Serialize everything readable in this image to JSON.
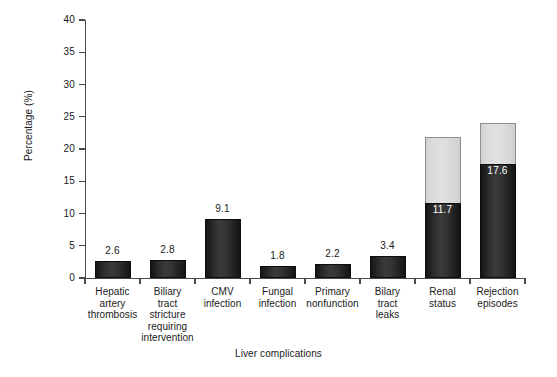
{
  "chart_data": {
    "type": "bar",
    "title": "",
    "xlabel": "Liver complications",
    "ylabel": "Percentage (%)",
    "ylim": [
      0,
      40
    ],
    "yticks": [
      0,
      5,
      10,
      15,
      20,
      25,
      30,
      35,
      40
    ],
    "grid": false,
    "legend": null,
    "stacked": true,
    "categories": [
      "Hepatic artery thrombosis",
      "Biliary tract stricture requiring intervention",
      "CMV infection",
      "Fungal infection",
      "Primary nonfunction",
      "Bilary tract leaks",
      "Renal status",
      "Rejection episodes"
    ],
    "category_lines": [
      [
        "Hepatic",
        "artery",
        "thrombosis"
      ],
      [
        "Biliary",
        "tract",
        "stricture",
        "requiring",
        "intervention"
      ],
      [
        "CMV",
        "infection"
      ],
      [
        "Fungal",
        "infection"
      ],
      [
        "Primary",
        "nonfunction"
      ],
      [
        "Bilary",
        "tract",
        "leaks"
      ],
      [
        "Renal",
        "status"
      ],
      [
        "Rejection",
        "episodes"
      ]
    ],
    "series": [
      {
        "name": "dark-segment",
        "color": "#242424",
        "values": [
          2.6,
          2.8,
          9.1,
          1.8,
          2.2,
          3.4,
          11.7,
          17.6
        ]
      },
      {
        "name": "light-segment",
        "color": "#dcdcdc",
        "values": [
          0,
          0,
          0,
          0,
          0,
          0,
          10.2,
          6.4
        ]
      }
    ],
    "totals": [
      2.6,
      2.8,
      9.1,
      1.8,
      2.2,
      3.4,
      21.9,
      24.0
    ],
    "point_labels": [
      {
        "category": "Hepatic artery thrombosis",
        "text": "2.6",
        "position": "above",
        "color": "#1a1a1a"
      },
      {
        "category": "Biliary tract stricture requiring intervention",
        "text": "2.8",
        "position": "above",
        "color": "#1a1a1a"
      },
      {
        "category": "CMV infection",
        "text": "9.1",
        "position": "above",
        "color": "#1a1a1a"
      },
      {
        "category": "Fungal infection",
        "text": "1.8",
        "position": "above",
        "color": "#1a1a1a"
      },
      {
        "category": "Primary nonfunction",
        "text": "2.2",
        "position": "above",
        "color": "#1a1a1a"
      },
      {
        "category": "Bilary tract leaks",
        "text": "3.4",
        "position": "above",
        "color": "#1a1a1a"
      },
      {
        "category": "Renal status",
        "text": "11.7",
        "position": "inside-dark-top",
        "color": "#ffffff"
      },
      {
        "category": "Rejection episodes",
        "text": "17.6",
        "position": "inside-dark-top",
        "color": "#ffffff"
      }
    ]
  },
  "axis": {
    "y_title": "Percentage (%)",
    "x_title": "Liver complications",
    "y_tick_labels": [
      "0",
      "5",
      "10",
      "15",
      "20",
      "25",
      "30",
      "35",
      "40"
    ]
  },
  "values": {
    "v0": "2.6",
    "v1": "2.8",
    "v2": "9.1",
    "v3": "1.8",
    "v4": "2.2",
    "v5": "3.4",
    "v6": "11.7",
    "v7": "17.6"
  }
}
